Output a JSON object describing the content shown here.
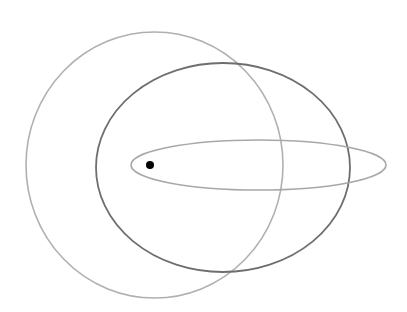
{
  "diagram": {
    "width": 407,
    "height": 312,
    "background": "#ffffff",
    "shapes": [
      {
        "id": "circular-orbit",
        "type": "ellipse",
        "cx": 154.5,
        "cy": 165,
        "rx": 128.5,
        "ry": 133,
        "stroke": "#b0b0b0",
        "stroke_width": 1.6
      },
      {
        "id": "moderate-eccentric-orbit",
        "type": "ellipse",
        "cx": 223,
        "cy": 167.5,
        "rx": 127,
        "ry": 104.5,
        "stroke": "#6e6e6e",
        "stroke_width": 1.8
      },
      {
        "id": "high-eccentric-orbit",
        "type": "ellipse",
        "cx": 258.5,
        "cy": 165,
        "rx": 127.5,
        "ry": 25,
        "stroke": "#a8a8a8",
        "stroke_width": 1.6
      }
    ],
    "focus_point": {
      "id": "central-body",
      "cx": 150,
      "cy": 165,
      "r": 4,
      "fill": "#000000"
    }
  }
}
